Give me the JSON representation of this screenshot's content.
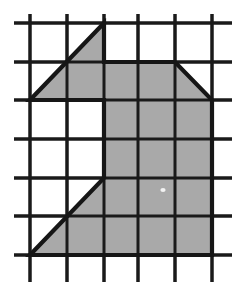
{
  "figure": {
    "canvas": {
      "width": 243,
      "height": 291
    },
    "colors": {
      "background": "#ffffff",
      "grid_line": "#1a1a1a",
      "shape_fill": "#a9a9a9",
      "shape_outline": "#161616"
    },
    "grid": {
      "type": "square-lattice",
      "columns": 6,
      "rows": 7,
      "cell_width": 37,
      "cell_height": 38.5,
      "vertical_line_x": [
        30,
        67,
        104,
        138,
        175,
        212
      ],
      "horizontal_line_y": [
        23,
        62,
        100,
        139,
        178,
        216,
        255
      ],
      "vertical_line_top": 14,
      "vertical_line_bottom": 282,
      "horizontal_line_left": 14,
      "horizontal_line_right": 232,
      "line_width": 3
    },
    "shape": {
      "name": "shaded-polygon",
      "vertex_count": 9,
      "vertices": [
        [
          104,
          23
        ],
        [
          104,
          62
        ],
        [
          175,
          62
        ],
        [
          212,
          100
        ],
        [
          212,
          255
        ],
        [
          30,
          255
        ],
        [
          104,
          178
        ],
        [
          104,
          100
        ],
        [
          30,
          100
        ]
      ],
      "outline_width": 4.2,
      "closed": true
    },
    "artifact": {
      "name": "white-speck",
      "x": 163,
      "y": 190,
      "rx": 2.6,
      "ry": 1.9
    }
  }
}
